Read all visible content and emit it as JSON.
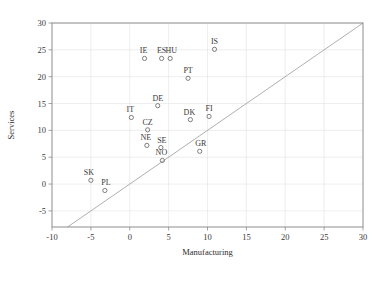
{
  "chart_data": {
    "type": "scatter",
    "title": "",
    "xlabel": "Manufacturing",
    "ylabel": "Services",
    "xlim": [
      -10,
      30
    ],
    "ylim": [
      -8,
      30
    ],
    "xticks": [
      -10,
      -5,
      0,
      5,
      10,
      15,
      20,
      25,
      30
    ],
    "yticks": [
      -5,
      0,
      5,
      10,
      15,
      20,
      25,
      30
    ],
    "xtick_labels": [
      "-10",
      "-5",
      "0",
      "5",
      "10",
      "15",
      "20",
      "25",
      "30"
    ],
    "ytick_labels": [
      "-5",
      "0",
      "5",
      "10",
      "15",
      "20",
      "25",
      "30"
    ],
    "grid": true,
    "legend": "none",
    "marker": "open-circle",
    "reference_line": {
      "name": "identity-line",
      "equation": "y = x",
      "from": [
        -8,
        -8
      ],
      "to": [
        30,
        30
      ]
    },
    "points": [
      {
        "label": "SK",
        "x": -5.0,
        "y": 0.7,
        "label_dx": -2,
        "label_dy": -5
      },
      {
        "label": "PL",
        "x": -3.2,
        "y": -1.2,
        "label_dx": 1,
        "label_dy": -5
      },
      {
        "label": "IT",
        "x": 0.2,
        "y": 12.4,
        "label_dx": -1,
        "label_dy": -5
      },
      {
        "label": "CZ",
        "x": 2.3,
        "y": 10.1,
        "label_dx": 0,
        "label_dy": -5
      },
      {
        "label": "NE",
        "x": 2.2,
        "y": 7.2,
        "label_dx": -1,
        "label_dy": -5
      },
      {
        "label": "DE",
        "x": 3.6,
        "y": 14.6,
        "label_dx": 0,
        "label_dy": -5
      },
      {
        "label": "SE",
        "x": 4.0,
        "y": 6.8,
        "label_dx": 1,
        "label_dy": -5
      },
      {
        "label": "NO",
        "x": 4.2,
        "y": 4.4,
        "label_dx": -1,
        "label_dy": -5
      },
      {
        "label": "IE",
        "x": 1.9,
        "y": 23.4,
        "label_dx": -1,
        "label_dy": -5
      },
      {
        "label": "ES",
        "x": 4.1,
        "y": 23.4,
        "label_dx": 0,
        "label_dy": -5
      },
      {
        "label": "HU",
        "x": 5.2,
        "y": 23.4,
        "label_dx": 1,
        "label_dy": -5
      },
      {
        "label": "PT",
        "x": 7.5,
        "y": 19.7,
        "label_dx": 0,
        "label_dy": -5
      },
      {
        "label": "DK",
        "x": 7.8,
        "y": 12.0,
        "label_dx": -1,
        "label_dy": -5
      },
      {
        "label": "FI",
        "x": 10.2,
        "y": 12.6,
        "label_dx": 0,
        "label_dy": -5
      },
      {
        "label": "GR",
        "x": 9.0,
        "y": 6.1,
        "label_dx": 1,
        "label_dy": -5
      },
      {
        "label": "IS",
        "x": 10.9,
        "y": 25.1,
        "label_dx": 0,
        "label_dy": -5
      }
    ]
  }
}
